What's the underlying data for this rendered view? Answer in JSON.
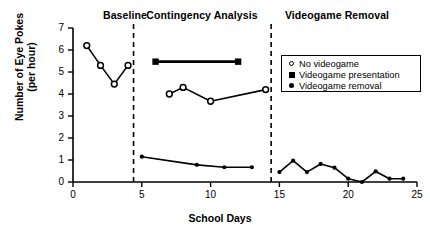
{
  "chart_data": {
    "type": "line",
    "title": "",
    "xlabel": "School Days",
    "ylabel": "Number of Eye Pokes",
    "ylabel_line2": "(per hour)",
    "xlim": [
      0,
      25
    ],
    "ylim": [
      0,
      7
    ],
    "xticks": [
      0,
      5,
      10,
      15,
      20,
      25
    ],
    "yticks": [
      0,
      1,
      2,
      3,
      4,
      5,
      6,
      7
    ],
    "grid": false,
    "legend_position": "upper right",
    "phase_labels": [
      "Baseline",
      "Contingency Analysis",
      "Videogame Removal"
    ],
    "phase_dividers": [
      4.4,
      14.4
    ],
    "legend": [
      {
        "label": "No videogame",
        "marker": "open-circle"
      },
      {
        "label": "Videogame presentation",
        "marker": "filled-square"
      },
      {
        "label": "Videogame removal",
        "marker": "filled-circle"
      }
    ],
    "series": [
      {
        "name": "No videogame",
        "marker": "open-circle",
        "segments": [
          {
            "phase": "Baseline",
            "x": [
              1,
              2,
              3,
              4
            ],
            "y": [
              6.2,
              5.3,
              4.45,
              5.3
            ]
          },
          {
            "phase": "Contingency Analysis",
            "x": [
              7,
              8,
              10,
              14
            ],
            "y": [
              4.0,
              4.3,
              3.67,
              4.2
            ]
          }
        ]
      },
      {
        "name": "Videogame presentation",
        "marker": "filled-square",
        "segments": [
          {
            "phase": "Contingency Analysis",
            "x": [
              6,
              12
            ],
            "y": [
              5.47,
              5.47
            ]
          }
        ]
      },
      {
        "name": "Videogame removal",
        "marker": "filled-circle",
        "segments": [
          {
            "phase": "Contingency Analysis",
            "x": [
              5,
              9,
              11,
              13
            ],
            "y": [
              1.15,
              0.78,
              0.67,
              0.67
            ]
          },
          {
            "phase": "Videogame Removal",
            "x": [
              15,
              16,
              17,
              18,
              19,
              20,
              21,
              22,
              23,
              24
            ],
            "y": [
              0.45,
              0.97,
              0.45,
              0.82,
              0.65,
              0.15,
              0.0,
              0.48,
              0.15,
              0.15
            ]
          }
        ]
      }
    ]
  },
  "colors": {
    "ink": "#000000",
    "background": "#ffffff"
  }
}
